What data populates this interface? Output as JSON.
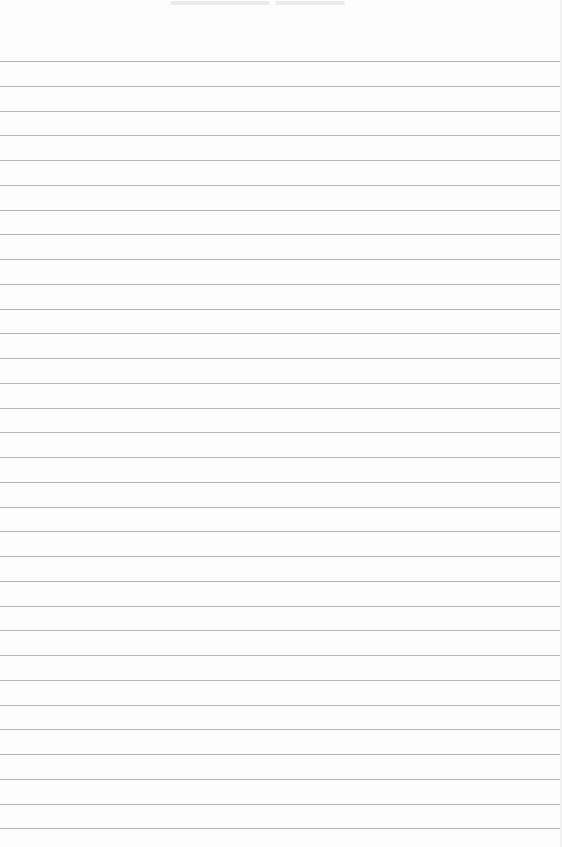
{
  "page": {
    "type": "lined paper",
    "background_color": "#fdfdfd",
    "line_color": "#b5b5b5",
    "first_line_y": 61,
    "line_spacing": 24.75,
    "line_count": 32
  },
  "header": {
    "marks": [
      {
        "x": 170,
        "w": 100
      },
      {
        "x": 275,
        "w": 70
      }
    ]
  }
}
